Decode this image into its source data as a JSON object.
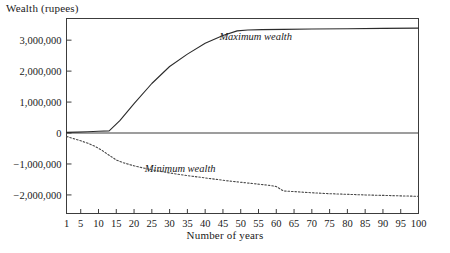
{
  "chart_data": {
    "type": "line",
    "title": "",
    "xlabel": "Number of years",
    "ylabel": "Wealth (rupees)",
    "xlim": [
      1,
      100
    ],
    "ylim": [
      -2600000,
      3700000
    ],
    "grid": false,
    "legend_position": "inline-annotation",
    "x_ticks": [
      1,
      5,
      10,
      15,
      20,
      25,
      30,
      35,
      40,
      45,
      50,
      55,
      60,
      65,
      70,
      75,
      80,
      85,
      90,
      95,
      100
    ],
    "x_tick_labels": [
      "1",
      "5",
      "10",
      "15",
      "20",
      "25",
      "30",
      "35",
      "40",
      "45",
      "50",
      "55",
      "60",
      "65",
      "70",
      "75",
      "80",
      "85",
      "90",
      "95",
      "100"
    ],
    "y_ticks": [
      3000000,
      2000000,
      1000000,
      0,
      -1000000,
      -2000000
    ],
    "y_tick_labels": [
      "3,000,000",
      "2,000,000",
      "1,000,000",
      "0",
      "−1,000,000",
      "−2,000,000"
    ],
    "series": [
      {
        "name": "Maximum wealth",
        "style": "solid",
        "color": "#2b2b2b",
        "annotation": "Maximum wealth",
        "x": [
          1,
          4,
          7,
          10,
          13,
          16,
          20,
          25,
          30,
          35,
          40,
          45,
          49,
          52,
          56,
          62,
          70,
          80,
          90,
          100
        ],
        "values": [
          20000,
          30000,
          40000,
          55000,
          70000,
          400000,
          950000,
          1600000,
          2150000,
          2550000,
          2900000,
          3150000,
          3300000,
          3330000,
          3340000,
          3350000,
          3360000,
          3370000,
          3380000,
          3390000
        ]
      },
      {
        "name": "Minimum wealth",
        "style": "dotted",
        "color": "#4a4a4a",
        "annotation": "Minimum wealth",
        "x": [
          1,
          3,
          5,
          7,
          9,
          11,
          13,
          15,
          17,
          20,
          23,
          26,
          30,
          34,
          38,
          42,
          46,
          50,
          54,
          58,
          60,
          62,
          66,
          70,
          75,
          80,
          85,
          90,
          95,
          100
        ],
        "values": [
          -110000,
          -180000,
          -250000,
          -330000,
          -430000,
          -560000,
          -720000,
          -870000,
          -960000,
          -1060000,
          -1140000,
          -1210000,
          -1290000,
          -1360000,
          -1420000,
          -1480000,
          -1540000,
          -1590000,
          -1640000,
          -1690000,
          -1730000,
          -1870000,
          -1900000,
          -1930000,
          -1960000,
          -1980000,
          -2000000,
          -2015000,
          -2030000,
          -2045000
        ]
      }
    ],
    "annotations": [
      {
        "text": "Maximum wealth",
        "x_year": 44,
        "y_value": 3060000
      },
      {
        "text": "Minimum wealth",
        "x_year": 23,
        "y_value": -1210000
      }
    ]
  },
  "figure": {
    "background_color": "#ffffff",
    "axis_color": "#3c3c3c",
    "text_color": "#1a1a1a"
  }
}
